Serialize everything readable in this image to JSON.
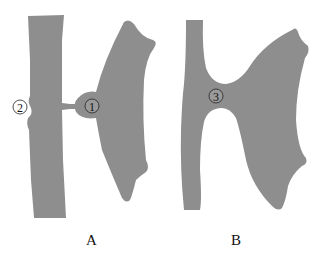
{
  "figure": {
    "panels": [
      {
        "id": "A",
        "label": "A",
        "markers": [
          {
            "symbol": "①",
            "number": "1",
            "position": "junction bulge between cells"
          },
          {
            "symbol": "②",
            "number": "2",
            "position": "notch on left cell edge"
          }
        ]
      },
      {
        "id": "B",
        "label": "B",
        "markers": [
          {
            "symbol": "③",
            "number": "3",
            "position": "fused junction between cells"
          }
        ]
      }
    ],
    "colors": {
      "tissue": "#8e8e8e",
      "background": "#ffffff",
      "text": "#111111"
    }
  }
}
